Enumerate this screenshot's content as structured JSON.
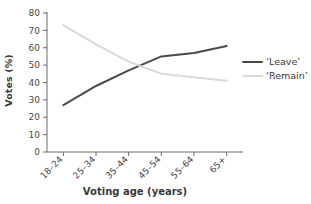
{
  "chart_data": {
    "type": "line",
    "title": "",
    "xlabel": "Voting age (years)",
    "ylabel": "Votes (%)",
    "categories": [
      "18–24",
      "25–34",
      "35–44",
      "45–54",
      "55–64",
      "65+"
    ],
    "series": [
      {
        "name": "‘Leave’",
        "values": [
          27,
          38,
          47,
          55,
          57,
          61
        ],
        "color": "#4a4a4a"
      },
      {
        "name": "‘Remain’",
        "values": [
          73,
          62,
          52,
          45,
          43,
          41
        ],
        "color": "#d9d9d9"
      }
    ],
    "ylim": [
      0,
      80
    ],
    "yticks": [
      0,
      10,
      20,
      30,
      40,
      50,
      60,
      70,
      80
    ],
    "ytick_labels": [
      "0",
      "10",
      "20",
      "30",
      "40",
      "50",
      "60",
      "70",
      "80"
    ],
    "grid": false,
    "legend_position": "right",
    "legend_entries": [
      "‘Leave’",
      "‘Remain’"
    ]
  },
  "axes": {
    "y_title": "Votes (%)",
    "x_title": "Voting age (years)"
  },
  "legend": {
    "items": [
      {
        "label": "‘Leave’"
      },
      {
        "label": "‘Remain’"
      }
    ]
  }
}
